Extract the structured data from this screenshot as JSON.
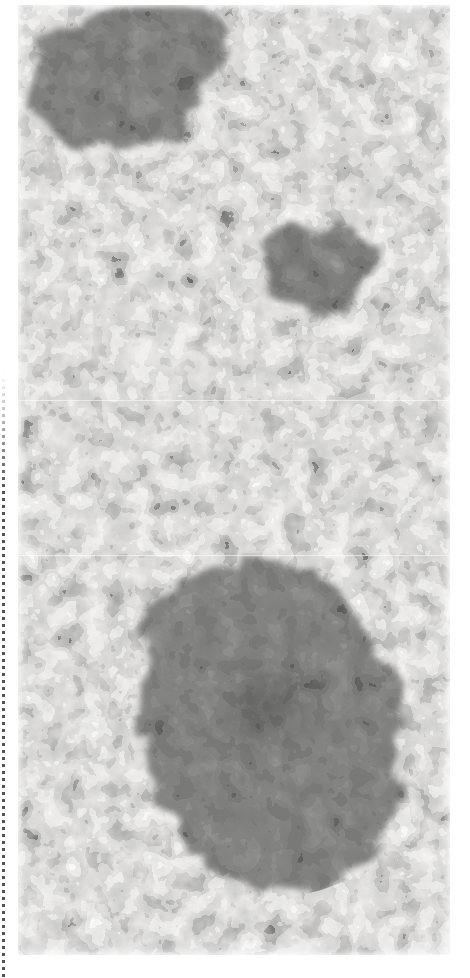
{
  "document": {
    "kind": "scanned-halftone-photographic-plate",
    "page_background": "#ffffff",
    "plate_background": "#f0efec"
  },
  "binding_rule": {
    "name": "dotted-binding-rule",
    "color": "#3a3a3a",
    "x": 3,
    "top": 372,
    "bottom": 978
  },
  "plate": {
    "x": 18,
    "y": 5,
    "width": 432,
    "height": 950,
    "tone_light": "#f2f1ee",
    "tone_midspeckle": "#8c8c8c",
    "tone_blob": "#7c7c7c",
    "tone_core": "#6a6a68",
    "tone_darkspeckle": "#4a4a4a",
    "tone_highlight": "#ffffff"
  },
  "chart_data": {
    "type": "heatmap",
    "title": "",
    "xlabel": "",
    "ylabel": "",
    "grid": false,
    "legend": "none",
    "xlim": [
      0,
      432
    ],
    "ylim": [
      0,
      950
    ],
    "features": [
      {
        "name": "dark-blob-upper-left",
        "cx": 105,
        "cy": 70,
        "rx": 86,
        "ry": 72,
        "tone": "#7a7a7a",
        "label": "upper-left condensation"
      },
      {
        "name": "dark-blob-upper-right",
        "cx": 300,
        "cy": 265,
        "rx": 55,
        "ry": 45,
        "tone": "#787878",
        "label": "upper-right condensation"
      },
      {
        "name": "faint-diffuse-object",
        "cx": 140,
        "cy": 352,
        "rx": 52,
        "ry": 34,
        "tone": "#e2e1dd",
        "label": "faint diffuse patch"
      },
      {
        "name": "large-blob-lower",
        "cx": 250,
        "cy": 713,
        "rx": 135,
        "ry": 140,
        "tone": "#7c7c7c",
        "label": "large lower condensation"
      },
      {
        "name": "dark-core-lower",
        "cx": 250,
        "cy": 702,
        "rx": 54,
        "ry": 52,
        "tone": "#696967",
        "label": "inner dark core"
      }
    ],
    "values_note": "Tone field only — no numeric axis labels are printed on the plate"
  }
}
